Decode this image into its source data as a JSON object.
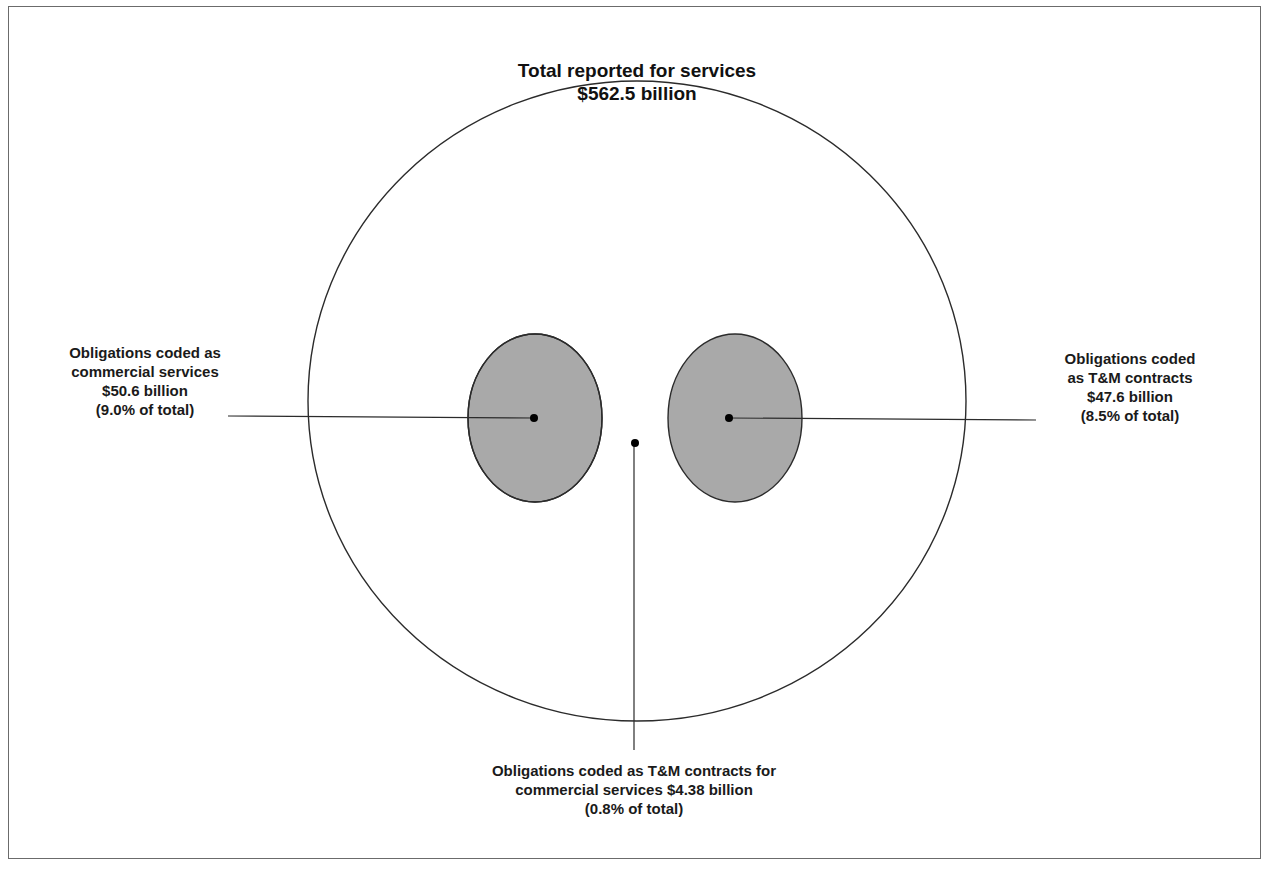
{
  "title": {
    "line1": "Total reported for services",
    "line2": "$562.5 billion"
  },
  "sets": {
    "total": {
      "name": "Total reported for services",
      "value_billion": 562.5
    },
    "commercial": {
      "lines": [
        "Obligations coded as",
        "commercial services",
        "$50.6 billion",
        "(9.0% of total)"
      ],
      "value_billion": 50.6,
      "percent_of_total": 9.0
    },
    "tm": {
      "lines": [
        "Obligations coded",
        "as T&M contracts",
        "$47.6 billion",
        "(8.5% of total)"
      ],
      "value_billion": 47.6,
      "percent_of_total": 8.5
    },
    "overlap": {
      "lines": [
        "Obligations coded as T&M contracts for",
        "commercial services $4.38 billion",
        "(0.8% of total)"
      ],
      "value_billion": 4.38,
      "percent_of_total": 0.8
    }
  },
  "colors": {
    "outline": "#2b2b2b",
    "circle_fill": "#a9a9a9",
    "overlap_fill": "#7a7a7a",
    "frame": "#6b6b6b",
    "dot": "#000000"
  }
}
